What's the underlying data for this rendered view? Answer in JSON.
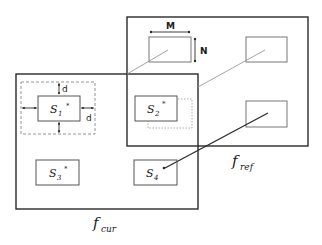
{
  "diagram": {
    "frames": {
      "reference": {
        "label_main": "f",
        "label_sub": "ref"
      },
      "current": {
        "label_main": "f",
        "label_sub": "cur"
      }
    },
    "blocks": [
      {
        "id": "S1",
        "label_main": "S",
        "label_sub": "1",
        "mark": "*"
      },
      {
        "id": "S2",
        "label_main": "S",
        "label_sub": "2",
        "mark": "*"
      },
      {
        "id": "S3",
        "label_main": "S",
        "label_sub": "3",
        "mark": "*"
      },
      {
        "id": "S4",
        "label_main": "S",
        "label_sub": "4",
        "mark": ""
      }
    ],
    "dimensions": {
      "width_label": "M",
      "height_label": "N",
      "search_margin_top": "d",
      "search_margin_right": "d"
    },
    "colors": {
      "stroke": "#2a2a2a",
      "dashed": "#777777",
      "faint_line": "#9a9a9a",
      "background": "#ffffff"
    }
  }
}
